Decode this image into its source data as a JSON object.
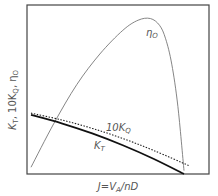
{
  "chart_data": {
    "type": "line",
    "title": "",
    "xlabel": "J = V_A / nD",
    "ylabel": "K_T, 10K_Q, η_O",
    "xlabel_parts": {
      "main": "J=V",
      "sub": "A",
      "rest": "/nD"
    },
    "ylabel_parts": {
      "k": "K",
      "t": "T",
      "mid": ", 10K",
      "q": "Q",
      "end": ", η",
      "o": "O"
    },
    "grid": false,
    "legend": "inline labels",
    "x_range": [
      0,
      1
    ],
    "y_range": [
      0,
      1
    ],
    "series": [
      {
        "name": "η_O",
        "label_main": "η",
        "label_sub": "O",
        "style": "solid thin gray",
        "x": [
          0.0,
          0.15,
          0.3,
          0.45,
          0.6,
          0.7,
          0.78,
          0.84,
          0.88,
          0.92,
          0.96,
          1.0
        ],
        "y": [
          0.04,
          0.3,
          0.53,
          0.71,
          0.85,
          0.91,
          0.92,
          0.88,
          0.8,
          0.65,
          0.4,
          0.02
        ]
      },
      {
        "name": "10K_Q",
        "label_main": "10K",
        "label_sub": "Q",
        "style": "dotted",
        "x": [
          0.0,
          0.2,
          0.4,
          0.6,
          0.8,
          1.03
        ],
        "y": [
          0.36,
          0.32,
          0.27,
          0.21,
          0.14,
          0.05
        ]
      },
      {
        "name": "K_T",
        "label_main": "K",
        "label_sub": "T",
        "style": "solid thick black",
        "x": [
          0.0,
          0.2,
          0.4,
          0.6,
          0.8,
          1.0
        ],
        "y": [
          0.35,
          0.3,
          0.24,
          0.17,
          0.09,
          0.0
        ]
      }
    ]
  }
}
